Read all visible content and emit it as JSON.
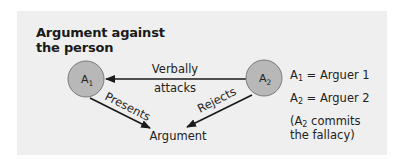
{
  "title": "Argument against the person",
  "nodes": {
    "a1": {
      "symbol": "A",
      "subscript": "1"
    },
    "a2": {
      "symbol": "A",
      "subscript": "2"
    },
    "argument": {
      "label": "Argument"
    }
  },
  "edges": {
    "verbally_attacks": {
      "line1": "Verbally",
      "line2": "attacks",
      "from": "a2",
      "to": "a1"
    },
    "presents": {
      "label": "Presents",
      "from": "a1",
      "to": "argument"
    },
    "rejects": {
      "label": "Rejects",
      "from": "a2",
      "to": "argument"
    }
  },
  "legend": {
    "a1": {
      "symbol": "A",
      "subscript": "1",
      "text": " = Arguer 1"
    },
    "a2": {
      "symbol": "A",
      "subscript": "2",
      "text": " = Arguer 2"
    },
    "note": {
      "prefix": "(A",
      "subscript": "2",
      "text": " commits the fallacy)"
    }
  },
  "colors": {
    "panel_bg": "#efefef",
    "node_fill": "#b8b8b8",
    "node_stroke": "#7a7a7a",
    "arrow": "#1a1a1a"
  }
}
